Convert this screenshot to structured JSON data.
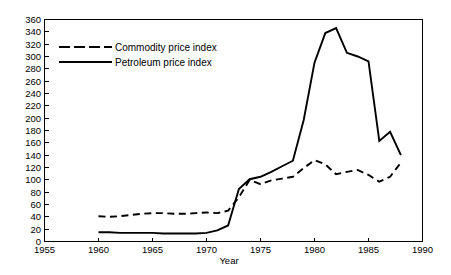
{
  "chart_data": {
    "type": "line",
    "title": "",
    "xlabel": "Year",
    "ylabel": "",
    "xlim": [
      1955,
      1990
    ],
    "ylim": [
      0,
      360
    ],
    "xticks": [
      1955,
      1960,
      1965,
      1970,
      1975,
      1980,
      1985,
      1990
    ],
    "yticks": [
      0,
      20,
      40,
      60,
      80,
      100,
      120,
      140,
      160,
      180,
      200,
      220,
      240,
      260,
      280,
      300,
      320,
      340,
      360
    ],
    "grid": false,
    "legend_position": "upper left",
    "series": [
      {
        "name": "Commodity price index",
        "style": "dashed",
        "color": "#000000",
        "x": [
          1960,
          1961,
          1962,
          1963,
          1964,
          1965,
          1966,
          1967,
          1968,
          1969,
          1970,
          1971,
          1972,
          1973,
          1974,
          1975,
          1976,
          1977,
          1978,
          1979,
          1980,
          1981,
          1982,
          1983,
          1984,
          1985,
          1986,
          1987,
          1988
        ],
        "values": [
          41,
          40,
          41,
          43,
          45,
          46,
          46,
          45,
          45,
          46,
          47,
          46,
          50,
          72,
          100,
          93,
          99,
          102,
          105,
          119,
          132,
          125,
          109,
          113,
          116,
          108,
          97,
          105,
          128
        ]
      },
      {
        "name": "Petroleum price index",
        "style": "solid",
        "color": "#000000",
        "x": [
          1960,
          1961,
          1962,
          1963,
          1964,
          1965,
          1966,
          1967,
          1968,
          1969,
          1970,
          1971,
          1972,
          1973,
          1974,
          1975,
          1976,
          1977,
          1978,
          1979,
          1980,
          1981,
          1982,
          1983,
          1984,
          1985,
          1986,
          1987,
          1988
        ],
        "values": [
          15,
          15,
          14,
          14,
          14,
          14,
          13,
          13,
          13,
          13,
          14,
          18,
          26,
          85,
          101,
          105,
          113,
          122,
          131,
          197,
          290,
          338,
          346,
          306,
          300,
          292,
          163,
          178,
          140
        ]
      }
    ],
    "annotations": []
  },
  "axes": {
    "x_tick_labels": [
      "1955",
      "1960",
      "1965",
      "1970",
      "1975",
      "1980",
      "1985",
      "1990"
    ],
    "y_tick_labels": [
      "0",
      "20",
      "40",
      "60",
      "80",
      "100",
      "120",
      "140",
      "160",
      "180",
      "200",
      "220",
      "240",
      "260",
      "280",
      "300",
      "320",
      "340",
      "360"
    ],
    "x_axis_title": "Year"
  },
  "legend": {
    "entries": [
      {
        "label": "Commodity price index",
        "style": "dashed"
      },
      {
        "label": "Petroleum price index",
        "style": "solid"
      }
    ]
  },
  "colors": {
    "ink": "#000000",
    "background": "#ffffff"
  }
}
